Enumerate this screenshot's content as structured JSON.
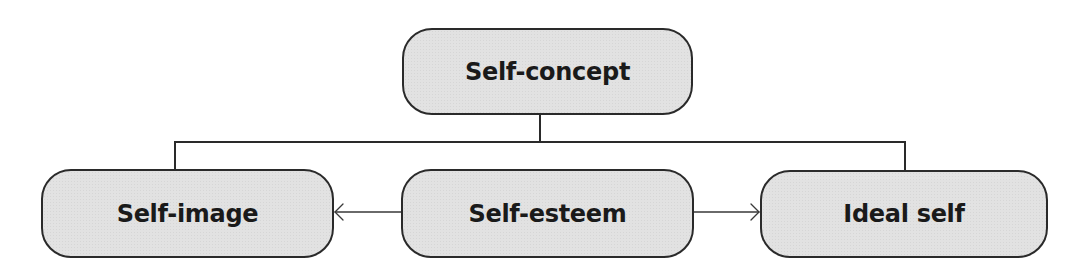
{
  "diagram": {
    "type": "hierarchy",
    "colors": {
      "node_fill": "#e2e2e2",
      "node_border": "#2a2a2a",
      "text": "#1a1a1a",
      "line": "#2a2a2a",
      "background": "#ffffff"
    },
    "nodes": {
      "root": {
        "label": "Self-concept"
      },
      "left": {
        "label": "Self-image"
      },
      "center": {
        "label": "Self-esteem"
      },
      "right": {
        "label": "Ideal self"
      }
    },
    "edges": [
      {
        "from": "Self-concept",
        "to": "Self-image",
        "style": "tree-line"
      },
      {
        "from": "Self-concept",
        "to": "Self-esteem",
        "style": "tree-line"
      },
      {
        "from": "Self-concept",
        "to": "Ideal self",
        "style": "tree-line"
      },
      {
        "from": "Self-esteem",
        "to": "Self-image",
        "style": "arrow"
      },
      {
        "from": "Self-esteem",
        "to": "Ideal self",
        "style": "arrow"
      }
    ]
  }
}
